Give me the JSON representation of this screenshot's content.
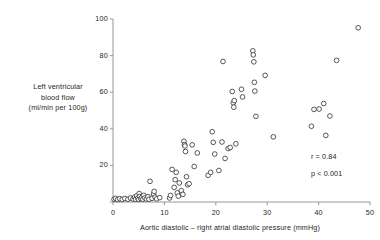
{
  "chart_data": {
    "type": "scatter",
    "title": "",
    "xlabel": "Aortic diastolic – right atrial diastolic pressure (mmHg)",
    "ylabel_lines": [
      "Left ventricular",
      "blood flow",
      "(ml/min per 100g)"
    ],
    "ylabel": "Left ventricular blood flow (ml/min per 100g)",
    "xlim": [
      0,
      50
    ],
    "ylim": [
      0,
      100
    ],
    "xticks": [
      0,
      10,
      20,
      30,
      40,
      50
    ],
    "yticks": [
      0,
      20,
      40,
      60,
      80,
      100
    ],
    "xtick_labels": [
      "0",
      "10",
      "20",
      "30",
      "40",
      "50"
    ],
    "ytick_labels": [
      "0",
      "20",
      "40",
      "60",
      "80",
      "100"
    ],
    "grid": false,
    "legend": null,
    "marker": "open-circle",
    "marker_fill": "#ffffff",
    "marker_stroke": "#3a3a3a",
    "axis_color": "#8c8c8c",
    "annotations": [
      {
        "text": "r = 0.84",
        "x": 38.5,
        "y": 24.5
      },
      {
        "text": "p < 0.001",
        "x": 38.5,
        "y": 15.5
      }
    ],
    "points": [
      {
        "x": 0.2,
        "y": 1.5
      },
      {
        "x": 0.5,
        "y": 2.0
      },
      {
        "x": 0.9,
        "y": 1.3
      },
      {
        "x": 1.3,
        "y": 1.8
      },
      {
        "x": 1.8,
        "y": 1.4
      },
      {
        "x": 2.3,
        "y": 1.9
      },
      {
        "x": 2.9,
        "y": 1.5
      },
      {
        "x": 3.4,
        "y": 2.2
      },
      {
        "x": 3.9,
        "y": 1.6
      },
      {
        "x": 4.2,
        "y": 2.6
      },
      {
        "x": 4.4,
        "y": 1.5
      },
      {
        "x": 4.6,
        "y": 3.4
      },
      {
        "x": 4.8,
        "y": 2.1
      },
      {
        "x": 5.0,
        "y": 1.4
      },
      {
        "x": 5.1,
        "y": 4.6
      },
      {
        "x": 5.2,
        "y": 3.0
      },
      {
        "x": 5.4,
        "y": 1.9
      },
      {
        "x": 5.6,
        "y": 2.5
      },
      {
        "x": 5.8,
        "y": 1.5
      },
      {
        "x": 6.0,
        "y": 3.6
      },
      {
        "x": 6.2,
        "y": 2.2
      },
      {
        "x": 6.5,
        "y": 1.6
      },
      {
        "x": 6.8,
        "y": 2.9
      },
      {
        "x": 7.0,
        "y": 1.5
      },
      {
        "x": 7.2,
        "y": 11.3
      },
      {
        "x": 7.6,
        "y": 2.0
      },
      {
        "x": 7.9,
        "y": 4.4
      },
      {
        "x": 8.0,
        "y": 5.8
      },
      {
        "x": 8.2,
        "y": 2.6
      },
      {
        "x": 8.5,
        "y": 1.7
      },
      {
        "x": 9.1,
        "y": 2.4
      },
      {
        "x": 11.0,
        "y": 2.2
      },
      {
        "x": 11.2,
        "y": 3.6
      },
      {
        "x": 11.5,
        "y": 17.8
      },
      {
        "x": 11.9,
        "y": 8.0
      },
      {
        "x": 12.1,
        "y": 12.2
      },
      {
        "x": 12.3,
        "y": 16.2
      },
      {
        "x": 12.5,
        "y": 5.0
      },
      {
        "x": 12.7,
        "y": 3.2
      },
      {
        "x": 12.9,
        "y": 10.4
      },
      {
        "x": 13.3,
        "y": 6.2
      },
      {
        "x": 13.6,
        "y": 4.2
      },
      {
        "x": 13.8,
        "y": 33.2
      },
      {
        "x": 13.9,
        "y": 31.4
      },
      {
        "x": 14.0,
        "y": 30.6
      },
      {
        "x": 14.1,
        "y": 27.6
      },
      {
        "x": 14.3,
        "y": 13.8
      },
      {
        "x": 14.5,
        "y": 9.4
      },
      {
        "x": 14.8,
        "y": 10.0
      },
      {
        "x": 15.4,
        "y": 31.2
      },
      {
        "x": 15.8,
        "y": 19.4
      },
      {
        "x": 16.4,
        "y": 26.8
      },
      {
        "x": 18.5,
        "y": 14.6
      },
      {
        "x": 19.0,
        "y": 16.2
      },
      {
        "x": 19.3,
        "y": 38.4
      },
      {
        "x": 19.5,
        "y": 32.6
      },
      {
        "x": 19.8,
        "y": 26.2
      },
      {
        "x": 20.6,
        "y": 17.2
      },
      {
        "x": 21.2,
        "y": 32.8
      },
      {
        "x": 21.4,
        "y": 76.8
      },
      {
        "x": 21.8,
        "y": 23.8
      },
      {
        "x": 22.4,
        "y": 29.2
      },
      {
        "x": 22.8,
        "y": 29.8
      },
      {
        "x": 23.2,
        "y": 60.4
      },
      {
        "x": 23.4,
        "y": 54.2
      },
      {
        "x": 23.5,
        "y": 51.8
      },
      {
        "x": 23.6,
        "y": 55.4
      },
      {
        "x": 23.9,
        "y": 31.8
      },
      {
        "x": 25.0,
        "y": 61.6
      },
      {
        "x": 25.2,
        "y": 57.4
      },
      {
        "x": 27.2,
        "y": 82.6
      },
      {
        "x": 27.3,
        "y": 80.4
      },
      {
        "x": 27.4,
        "y": 76.6
      },
      {
        "x": 27.5,
        "y": 65.4
      },
      {
        "x": 27.6,
        "y": 60.6
      },
      {
        "x": 27.8,
        "y": 46.8
      },
      {
        "x": 29.6,
        "y": 69.2
      },
      {
        "x": 31.2,
        "y": 35.6
      },
      {
        "x": 38.6,
        "y": 41.4
      },
      {
        "x": 39.1,
        "y": 50.6
      },
      {
        "x": 40.1,
        "y": 50.8
      },
      {
        "x": 41.0,
        "y": 53.8
      },
      {
        "x": 41.4,
        "y": 36.4
      },
      {
        "x": 42.2,
        "y": 47.0
      },
      {
        "x": 43.5,
        "y": 77.4
      },
      {
        "x": 47.7,
        "y": 95.2
      }
    ]
  }
}
